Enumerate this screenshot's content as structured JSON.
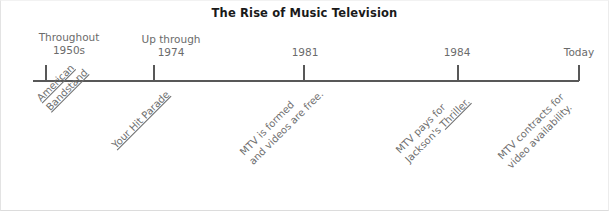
{
  "figure": {
    "title": "The Rise of Music Television"
  },
  "timeline": {
    "axis_color": "#585858",
    "text_color": "#6b6b6b",
    "markers": [
      {
        "id": "marker-1950s",
        "date_line1": "Throughout",
        "date_line2": "1950s",
        "tick_x": 44,
        "label_x": 68,
        "label_y": 30,
        "event_line1": "American",
        "event_line2": "Bandstand",
        "event_line1_underlined": true,
        "event_line2_underlined": true,
        "event_x": 33,
        "event_y": 94
      },
      {
        "id": "marker-1974",
        "date_line1": "Up through",
        "date_line2": "1974",
        "tick_x": 152,
        "label_x": 170,
        "label_y": 32,
        "event_line1": "Your Hit Parade",
        "event_line2": "",
        "event_line1_underlined": true,
        "event_line2_underlined": false,
        "event_x": 108,
        "event_y": 141
      },
      {
        "id": "marker-1981",
        "date_line1": "",
        "date_line2": "1981",
        "tick_x": 302,
        "label_x": 304,
        "label_y": 45,
        "event_line1": "MTV is formed",
        "event_line2": "and videos are free.",
        "event_line1_underlined": false,
        "event_line2_underlined": false,
        "event_x": 236,
        "event_y": 148
      },
      {
        "id": "marker-1984",
        "date_line1": "",
        "date_line2": "1984",
        "tick_x": 456,
        "label_x": 456,
        "label_y": 45,
        "event_line1": "MTV pays for",
        "event_line2": "Jackson's Thriller.",
        "event_line1_underlined": false,
        "event_line2_underlined": false,
        "event_x": 392,
        "event_y": 146
      },
      {
        "id": "marker-today",
        "date_line1": "",
        "date_line2": "Today",
        "tick_x": 577,
        "label_x": 578,
        "label_y": 45,
        "event_line1": "MTV contracts for",
        "event_line2": "video availability.",
        "event_line1_underlined": false,
        "event_line2_underlined": false,
        "event_x": 494,
        "event_y": 152
      }
    ]
  },
  "chart_data": {
    "type": "timeline",
    "title": "The Rise of Music Television",
    "orientation": "horizontal",
    "axis_range": [
      "Throughout 1950s",
      "Today"
    ],
    "grid": false,
    "legend": "none",
    "points": [
      {
        "x_label": "Throughout 1950s",
        "event": "American Bandstand",
        "note": "American Bandstand (underlined / italic title)"
      },
      {
        "x_label": "Up through 1974",
        "event": "Your Hit Parade",
        "note": "Your Hit Parade (underlined / italic title)"
      },
      {
        "x_label": "1981",
        "event": "MTV is formed and videos are free.",
        "note": ""
      },
      {
        "x_label": "1984",
        "event": "MTV pays for Jackson's Thriller.",
        "note": "Thriller underlined / italic title"
      },
      {
        "x_label": "Today",
        "event": "MTV contracts for video availability.",
        "note": ""
      }
    ]
  }
}
